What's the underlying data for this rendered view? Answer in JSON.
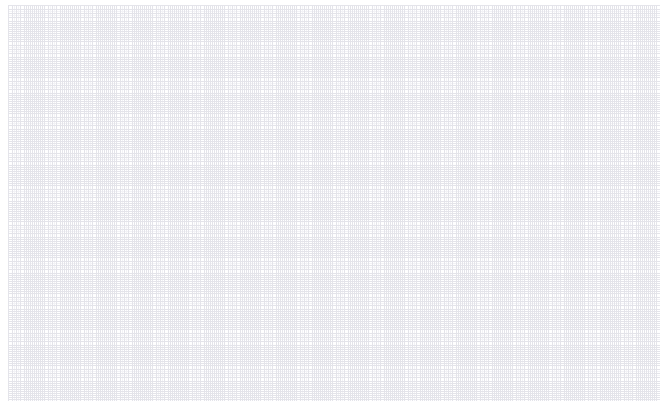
{
  "page": {
    "width": 672,
    "height": 414,
    "background_color": "#ffffff",
    "content_text": ""
  },
  "canvas": {
    "name": "grid-canvas",
    "description": "Empty document canvas covered by a faint dotted grid",
    "origin_x": 8,
    "origin_y": 5,
    "width": 652,
    "height": 396,
    "surface_color": "#ffffff",
    "has_visible_content": false,
    "has_text": false,
    "has_selection": false
  },
  "grid": {
    "visible": true,
    "style": "dotted",
    "major_spacing_px": 18,
    "minor_spacing_px": 6,
    "minor_per_major": 3,
    "major_color": "#e4e4ea",
    "minor_color": "#f2f2f6",
    "line_width_px": 1,
    "dash_length_px": 1,
    "dash_gap_px": 3,
    "major_columns": 36,
    "major_rows": 22
  },
  "margins": {
    "left_px": 8,
    "top_px": 5,
    "right_px": 12,
    "bottom_px": 13,
    "color": "#ffffff"
  },
  "empty_state": {
    "message": "",
    "visible": false
  }
}
